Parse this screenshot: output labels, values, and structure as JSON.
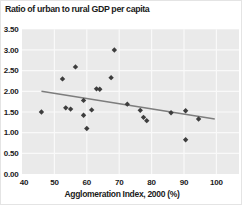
{
  "chart_data": {
    "type": "scatter",
    "title": "Ratio of urban to rural GDP per capita",
    "xlabel": "Agglomeration Index, 2000 (%)",
    "ylabel": "",
    "xlim": [
      40,
      107
    ],
    "ylim": [
      0,
      3.5
    ],
    "grid": true,
    "legend": false,
    "x_tick_values": [
      40,
      50,
      60,
      70,
      80,
      90,
      100
    ],
    "x_tick_labels": [
      "40",
      "50",
      "60",
      "70",
      "80",
      "90",
      "100"
    ],
    "y_tick_values": [
      3.5,
      3.0,
      2.5,
      2.0,
      1.5,
      1.0,
      0.5,
      0.0
    ],
    "y_tick_labels": [
      "3.50",
      "3.00",
      "2.50",
      "2.00",
      "1.50",
      "1.00",
      "0.50",
      "0.00"
    ],
    "points": [
      {
        "x": 46.0,
        "y": 1.5
      },
      {
        "x": 52.5,
        "y": 2.3
      },
      {
        "x": 53.5,
        "y": 1.6
      },
      {
        "x": 55.0,
        "y": 1.57
      },
      {
        "x": 56.5,
        "y": 2.59
      },
      {
        "x": 59.0,
        "y": 1.78
      },
      {
        "x": 59.0,
        "y": 1.42
      },
      {
        "x": 60.0,
        "y": 1.1
      },
      {
        "x": 61.5,
        "y": 1.55
      },
      {
        "x": 63.0,
        "y": 2.06
      },
      {
        "x": 64.0,
        "y": 2.05
      },
      {
        "x": 67.5,
        "y": 2.33
      },
      {
        "x": 68.5,
        "y": 3.0
      },
      {
        "x": 72.5,
        "y": 1.69
      },
      {
        "x": 76.5,
        "y": 1.54
      },
      {
        "x": 77.5,
        "y": 1.37
      },
      {
        "x": 78.5,
        "y": 1.29
      },
      {
        "x": 86.0,
        "y": 1.48
      },
      {
        "x": 90.5,
        "y": 1.53
      },
      {
        "x": 90.5,
        "y": 0.83
      },
      {
        "x": 94.5,
        "y": 1.33
      }
    ],
    "trend_line": {
      "x_start": 46.0,
      "y_start": 2.0,
      "x_end": 99.5,
      "y_end": 1.33
    },
    "colors": {
      "page_bg": "#ffffff",
      "plot_bg": "#eaeaea",
      "gridline": "#f9f9f9",
      "marker": "#3d3d3d",
      "trend": "#7d7d7d",
      "text": "#1a1a1a"
    }
  }
}
